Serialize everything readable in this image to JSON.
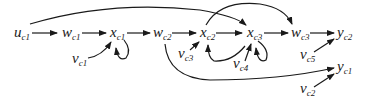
{
  "diagram": {
    "type": "signal-flow-graph",
    "nodes": [
      {
        "id": "u_c1",
        "base": "u",
        "sub": "c1",
        "x": 14,
        "y": 37
      },
      {
        "id": "w_c1",
        "base": "w",
        "sub": "c1",
        "x": 62,
        "y": 37
      },
      {
        "id": "x_c1",
        "base": "x",
        "sub": "c1",
        "x": 110,
        "y": 37
      },
      {
        "id": "v_c1",
        "base": "v",
        "sub": "c1",
        "x": 72,
        "y": 63
      },
      {
        "id": "w_c2",
        "base": "w",
        "sub": "c2",
        "x": 153,
        "y": 37
      },
      {
        "id": "x_c2",
        "base": "x",
        "sub": "c2",
        "x": 200,
        "y": 37
      },
      {
        "id": "v_c3",
        "base": "v",
        "sub": "c3",
        "x": 178,
        "y": 58
      },
      {
        "id": "x_c3",
        "base": "x",
        "sub": "c3",
        "x": 247,
        "y": 37
      },
      {
        "id": "v_c4",
        "base": "v",
        "sub": "c4",
        "x": 233,
        "y": 68
      },
      {
        "id": "w_c3",
        "base": "w",
        "sub": "c3",
        "x": 291,
        "y": 37
      },
      {
        "id": "y_c2",
        "base": "y",
        "sub": "c2",
        "x": 337,
        "y": 37
      },
      {
        "id": "v_c5",
        "base": "v",
        "sub": "c5",
        "x": 300,
        "y": 59
      },
      {
        "id": "y_c1",
        "base": "y",
        "sub": "c1",
        "x": 337,
        "y": 71
      },
      {
        "id": "v_c2",
        "base": "v",
        "sub": "c2",
        "x": 300,
        "y": 93
      }
    ],
    "edges": [
      {
        "from": "u_c1",
        "to": "w_c1"
      },
      {
        "from": "w_c1",
        "to": "x_c1"
      },
      {
        "from": "x_c1",
        "to": "w_c2"
      },
      {
        "from": "v_c1",
        "to": "x_c1"
      },
      {
        "from": "x_c1",
        "to": "x_c1",
        "kind": "self-loop"
      },
      {
        "from": "w_c2",
        "to": "x_c2"
      },
      {
        "from": "x_c2",
        "to": "x_c3"
      },
      {
        "from": "v_c3",
        "to": "x_c2"
      },
      {
        "from": "x_c3",
        "to": "x_c2",
        "kind": "curved"
      },
      {
        "from": "x_c3",
        "to": "x_c3",
        "kind": "self-loop"
      },
      {
        "from": "v_c4",
        "to": "x_c3"
      },
      {
        "from": "u_c1",
        "to": "x_c3",
        "kind": "long-arc"
      },
      {
        "from": "x_c2",
        "to": "w_c3",
        "kind": "arc"
      },
      {
        "from": "x_c3",
        "to": "w_c3"
      },
      {
        "from": "w_c3",
        "to": "y_c2"
      },
      {
        "from": "v_c5",
        "to": "y_c2"
      },
      {
        "from": "w_c2",
        "to": "y_c1",
        "kind": "long-arc"
      },
      {
        "from": "v_c2",
        "to": "y_c1"
      }
    ]
  }
}
